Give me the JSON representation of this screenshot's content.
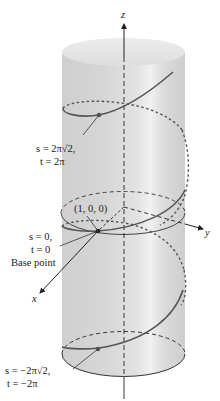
{
  "figure": {
    "axes": {
      "z_label": "z",
      "y_label": "y",
      "x_label": "x"
    },
    "labels": {
      "top_point_s": "s = 2π√2,",
      "top_point_t": "t = 2π",
      "base_point_coords": "(1, 0, 0)",
      "base_point_s": "s = 0,",
      "base_point_t": "t = 0",
      "base_point_caption": "Base point",
      "bottom_point_s": "s = −2π√2,",
      "bottom_point_t": "t = −2π"
    },
    "colors": {
      "cylinder_fill": "#d9d9d9",
      "cylinder_highlight": "#f2f2f2",
      "helix": "#555555",
      "axis": "#222222",
      "background": "#ffffff"
    }
  }
}
